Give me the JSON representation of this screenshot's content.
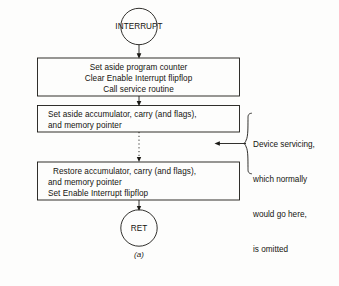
{
  "figure": {
    "caption": "(a)",
    "ink_color": "#1b1a16",
    "paper_color": "#fdfdfc"
  },
  "nodes": {
    "start": {
      "shape": "circle",
      "label": "INTERRUPT"
    },
    "process_1": {
      "shape": "rectangle",
      "lines": [
        "Set aside program counter",
        "Clear Enable Interrupt flipflop",
        "Call service routine"
      ]
    },
    "process_2": {
      "shape": "rectangle",
      "lines": [
        "Set aside accumulator, carry (and flags),",
        "and memory pointer"
      ]
    },
    "process_3": {
      "shape": "rectangle",
      "lines": [
        "Restore accumulator, carry (and flags),",
        "and memory pointer",
        "Set Enable Interrupt flipflop"
      ]
    },
    "end": {
      "shape": "circle",
      "label": "RET"
    }
  },
  "annotation": {
    "lines": [
      "Device servicing,",
      "which normally",
      "would go here,",
      "is omitted"
    ],
    "brace": "right-curly-brace",
    "pointer": "left-arrow"
  },
  "edges": [
    {
      "from": "start",
      "to": "process_1",
      "style": "solid",
      "arrow": "down"
    },
    {
      "from": "process_1",
      "to": "process_2",
      "style": "solid",
      "arrow": "down"
    },
    {
      "from": "process_2",
      "to": "process_3",
      "style": "dotted",
      "arrow": "down"
    },
    {
      "from": "process_3",
      "to": "end",
      "style": "solid",
      "arrow": "down"
    }
  ]
}
